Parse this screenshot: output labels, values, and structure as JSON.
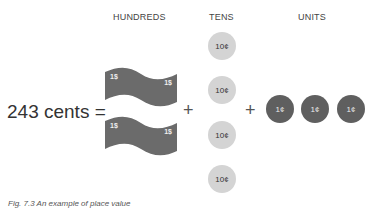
{
  "headers": {
    "hundreds": "HUNDREDS",
    "tens": "TENS",
    "units": "UNITS"
  },
  "equation": {
    "left": "243 cents =",
    "plus": "+"
  },
  "hundreds": {
    "bills": [
      {
        "left_label": "1$",
        "right_label": "1$"
      },
      {
        "left_label": "1$",
        "right_label": "1$"
      }
    ],
    "color": "#6b6b6b"
  },
  "tens": {
    "coins": [
      "10¢",
      "10¢",
      "10¢",
      "10¢"
    ],
    "color": "#d4d4d4"
  },
  "units": {
    "coins": [
      "1¢",
      "1¢",
      "1¢"
    ],
    "color": "#5f5f5f"
  },
  "caption": "Fig. 7.3 An example of place value"
}
